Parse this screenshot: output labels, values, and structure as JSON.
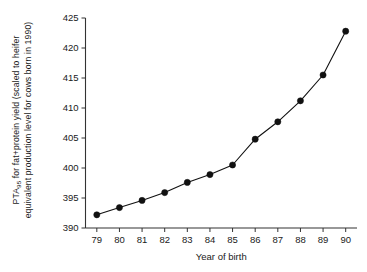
{
  "chart_data": {
    "type": "line",
    "title": "",
    "xlabel": "Year of birth",
    "ylabel_line1": "PTA95 for fat+protein yield (scaled to heifer",
    "ylabel_line2": "equivalent production level for cows born in 1990)",
    "ylabel_prefix": "PTA",
    "ylabel_subscript": "95",
    "ylabel_rest": " for fat+protein yield (scaled to heifer",
    "x": [
      79,
      80,
      81,
      82,
      83,
      84,
      85,
      86,
      87,
      88,
      89,
      90
    ],
    "xticklabels": [
      "79",
      "80",
      "81",
      "82",
      "83",
      "84",
      "85",
      "86",
      "87",
      "88",
      "89",
      "90"
    ],
    "values": [
      392.2,
      393.4,
      394.6,
      395.9,
      397.6,
      398.9,
      400.5,
      404.8,
      407.7,
      411.2,
      415.5,
      422.8
    ],
    "yticks": [
      390,
      395,
      400,
      405,
      410,
      415,
      420,
      425
    ],
    "yticklabels": [
      "390",
      "395",
      "400",
      "405",
      "410",
      "415",
      "420",
      "425"
    ],
    "ylim": [
      390,
      425
    ],
    "xlim": [
      78.5,
      90.5
    ],
    "grid": false,
    "legend": false,
    "marker": "filled-circle",
    "line_color": "#111111",
    "marker_color": "#111111",
    "axis_color": "#333333",
    "background": "#ffffff"
  }
}
